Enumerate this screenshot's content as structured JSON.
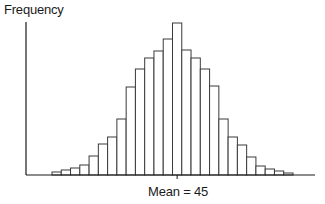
{
  "chart_data": {
    "type": "bar",
    "subtype": "histogram",
    "title": "",
    "xlabel": "",
    "ylabel": "Frequency",
    "annotation": "Mean = 45",
    "mean": 45,
    "mean_bin_index": 13,
    "categories": [
      "b1",
      "b2",
      "b3",
      "b4",
      "b5",
      "b6",
      "b7",
      "b8",
      "b9",
      "b10",
      "b11",
      "b12",
      "b13",
      "b14",
      "b15",
      "b16",
      "b17",
      "b18",
      "b19",
      "b20",
      "b21",
      "b22",
      "b23",
      "b24",
      "b25",
      "b26"
    ],
    "values": [
      3,
      5,
      7,
      10,
      19,
      31,
      38,
      56,
      88,
      106,
      117,
      124,
      136,
      152,
      125,
      117,
      106,
      89,
      56,
      38,
      30,
      18,
      9,
      6,
      4,
      2
    ],
    "value_units": "relative bar height (px), no y tick labels shown",
    "grid": false,
    "legend": null,
    "axis_ticks_labeled": false
  },
  "labels": {
    "ylabel": "Frequency",
    "mean_label": "Mean = 45"
  },
  "style": {
    "bar_fill": "#ffffff",
    "bar_stroke": "#3a3a3a",
    "axis_color": "#1a1a1a"
  }
}
